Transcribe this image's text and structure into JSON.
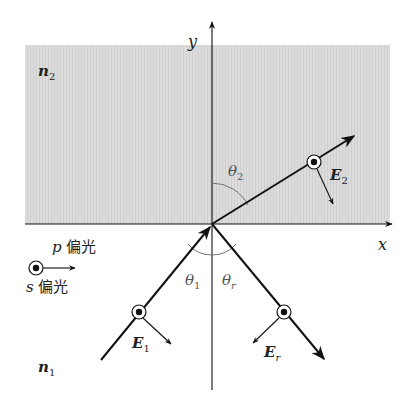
{
  "diagram": {
    "title": "",
    "type": "refraction-reflection-diagram",
    "media": {
      "upper": {
        "label": "n",
        "subscript": "2",
        "fill": "#d9d9d9"
      },
      "lower": {
        "label": "n",
        "subscript": "1",
        "fill": "#ffffff"
      }
    },
    "axes": {
      "x": {
        "label": "x"
      },
      "y": {
        "label": "y"
      }
    },
    "angles": {
      "incident": {
        "symbol": "θ",
        "subscript": "1"
      },
      "reflected": {
        "symbol": "θ",
        "subscript": "r"
      },
      "transmitted": {
        "symbol": "θ",
        "subscript": "2"
      }
    },
    "fields": {
      "incident": {
        "symbol": "E",
        "subscript": "1"
      },
      "reflected": {
        "symbol": "E",
        "subscript": "r"
      },
      "transmitted": {
        "symbol": "E",
        "subscript": "2"
      }
    },
    "legend": {
      "p_label_var": "p",
      "p_label_text": " 偏光",
      "s_label_var": "s",
      "s_label_text": " 偏光"
    },
    "colors": {
      "line": "#111111",
      "medium2": "#d9d9d9",
      "angle_arc": "#666666"
    }
  }
}
